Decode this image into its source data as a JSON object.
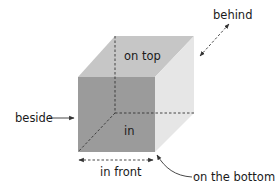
{
  "diagram": {
    "type": "prepositions-cube",
    "colors": {
      "front_face": "#9b9b9b",
      "top_face": "#c6c6c6",
      "side_face": "#e6e6e6",
      "lines": "#333333",
      "text": "#1a1a1a"
    },
    "labels": {
      "on_top": "on top",
      "behind": "behind",
      "beside": "beside",
      "in": "in",
      "in_front": "in front",
      "on_the_bottom": "on the bottom"
    }
  }
}
